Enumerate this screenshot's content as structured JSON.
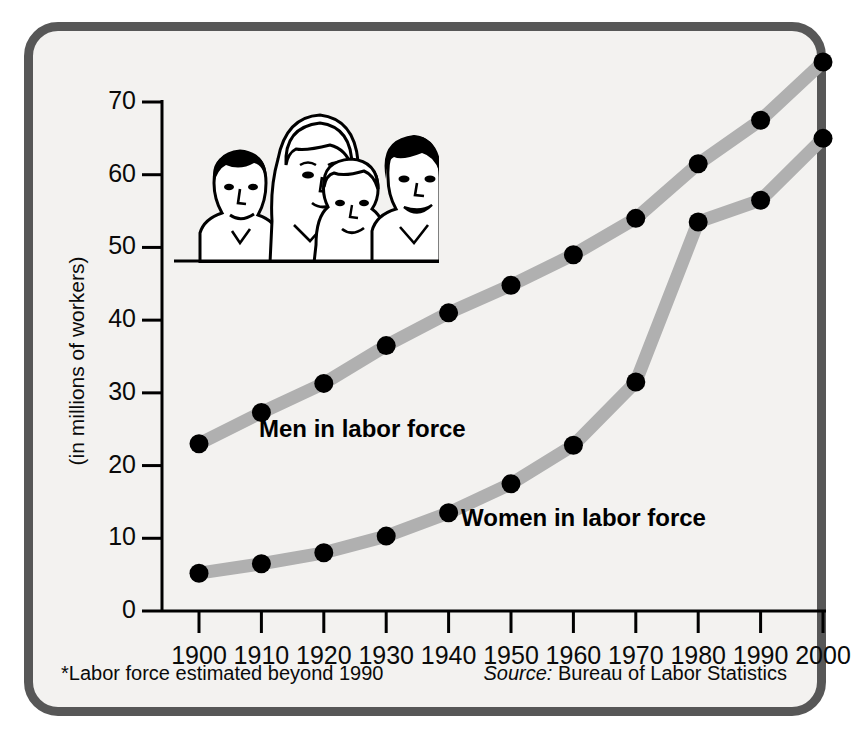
{
  "figure": {
    "background_color": "#f3f2f0",
    "frame_color": "#575757",
    "line_color": "#b0b0b0",
    "marker_color": "#000000"
  },
  "labels": {
    "men_series": "Men in labor force",
    "women_series": "Women in labor force",
    "ylabel": "(in millions of workers)",
    "footnote": "*Labor force estimated beyond 1990",
    "source_word": "Source:",
    "source_text": " Bureau of Labor Statistics",
    "illustration_name": "four-workers-illustration"
  },
  "chart_data": {
    "type": "line",
    "title": "",
    "xlabel": "",
    "ylabel": "(in millions of workers)",
    "categories": [
      "1900",
      "1910",
      "1920",
      "1930",
      "1940",
      "1950",
      "1960",
      "1970",
      "1980",
      "1990",
      "2000"
    ],
    "x": [
      1900,
      1910,
      1920,
      1930,
      1940,
      1950,
      1960,
      1970,
      1980,
      1990,
      2000
    ],
    "xlim": [
      1900,
      2000
    ],
    "ylim": [
      0,
      78
    ],
    "yticks": [
      0,
      10,
      20,
      30,
      40,
      50,
      60,
      70
    ],
    "ytick_labels": [
      "0",
      "10",
      "20",
      "30",
      "40",
      "50",
      "60",
      "70"
    ],
    "xtick_labels": [
      "1900",
      "1910",
      "1920",
      "1930",
      "1940",
      "1950",
      "1960",
      "1970",
      "1980",
      "1990",
      "2000"
    ],
    "grid": false,
    "legend_position": "inline-annotations",
    "series": [
      {
        "name": "Men in labor force",
        "values": [
          23.0,
          27.3,
          31.3,
          36.5,
          41.0,
          44.8,
          49.0,
          54.0,
          61.5,
          67.5,
          75.5
        ]
      },
      {
        "name": "Women in labor force",
        "values": [
          5.2,
          6.5,
          8.0,
          10.3,
          13.5,
          17.5,
          22.8,
          31.5,
          53.5,
          56.5,
          65.0
        ]
      }
    ],
    "annotations": [
      "*Labor force estimated beyond 1990",
      "Source: Bureau of Labor Statistics"
    ]
  }
}
